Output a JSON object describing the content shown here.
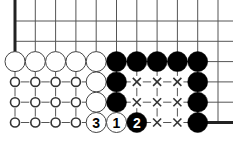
{
  "diagram": {
    "columns": 11,
    "rows": 6,
    "edges": [
      "left",
      "bottom-right"
    ],
    "colors": {
      "black": "#000000",
      "white": "#ffffff",
      "line": "#555555",
      "edge": "#222222",
      "mark": "#333333"
    },
    "stones": [
      {
        "col": 0,
        "row": 2,
        "color": "white",
        "label": ""
      },
      {
        "col": 1,
        "row": 2,
        "color": "white",
        "label": ""
      },
      {
        "col": 2,
        "row": 2,
        "color": "white",
        "label": ""
      },
      {
        "col": 3,
        "row": 2,
        "color": "white",
        "label": ""
      },
      {
        "col": 4,
        "row": 2,
        "color": "white",
        "label": ""
      },
      {
        "col": 5,
        "row": 2,
        "color": "black",
        "label": ""
      },
      {
        "col": 6,
        "row": 2,
        "color": "black",
        "label": ""
      },
      {
        "col": 7,
        "row": 2,
        "color": "black",
        "label": ""
      },
      {
        "col": 8,
        "row": 2,
        "color": "black",
        "label": ""
      },
      {
        "col": 9,
        "row": 2,
        "color": "black",
        "label": ""
      },
      {
        "col": 4,
        "row": 3,
        "color": "white",
        "label": ""
      },
      {
        "col": 5,
        "row": 3,
        "color": "black",
        "label": ""
      },
      {
        "col": 9,
        "row": 3,
        "color": "black",
        "label": ""
      },
      {
        "col": 4,
        "row": 4,
        "color": "white",
        "label": ""
      },
      {
        "col": 5,
        "row": 4,
        "color": "black",
        "label": ""
      },
      {
        "col": 9,
        "row": 4,
        "color": "black",
        "label": ""
      },
      {
        "col": 4,
        "row": 5,
        "color": "white",
        "label": "3"
      },
      {
        "col": 5,
        "row": 5,
        "color": "white",
        "label": "1"
      },
      {
        "col": 6,
        "row": 5,
        "color": "black",
        "label": "2"
      },
      {
        "col": 9,
        "row": 5,
        "color": "black",
        "label": ""
      }
    ],
    "circle_marks": [
      {
        "col": 0,
        "row": 3
      },
      {
        "col": 1,
        "row": 3
      },
      {
        "col": 2,
        "row": 3
      },
      {
        "col": 3,
        "row": 3
      },
      {
        "col": 0,
        "row": 4
      },
      {
        "col": 1,
        "row": 4
      },
      {
        "col": 2,
        "row": 4
      },
      {
        "col": 3,
        "row": 4
      },
      {
        "col": 0,
        "row": 5
      },
      {
        "col": 1,
        "row": 5
      },
      {
        "col": 2,
        "row": 5
      },
      {
        "col": 3,
        "row": 5
      }
    ],
    "cross_marks": [
      {
        "col": 6,
        "row": 3
      },
      {
        "col": 7,
        "row": 3
      },
      {
        "col": 8,
        "row": 3
      },
      {
        "col": 6,
        "row": 4
      },
      {
        "col": 7,
        "row": 4
      },
      {
        "col": 8,
        "row": 4
      },
      {
        "col": 7,
        "row": 5
      },
      {
        "col": 8,
        "row": 5
      }
    ]
  }
}
